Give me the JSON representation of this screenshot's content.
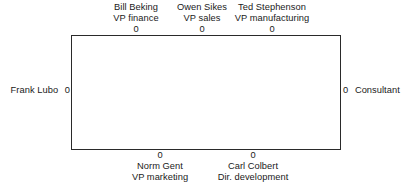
{
  "diagram": {
    "type": "boundary-node-diagram",
    "title": "",
    "box": {
      "label": "",
      "border_color": "#2a2a2a",
      "fill_color": "#ffffff"
    },
    "port_marker": "0",
    "nodes": {
      "top": [
        {
          "name": "Bill Beking",
          "title": "VP finance",
          "port": "0"
        },
        {
          "name": "Owen Sikes",
          "title": "VP sales",
          "port": "0"
        },
        {
          "name": "Ted Stephenson",
          "title": "VP manufacturing",
          "port": "0"
        }
      ],
      "bottom": [
        {
          "name": "Norm Gent",
          "title": "VP marketing",
          "port": "0"
        },
        {
          "name": "Carl Colbert",
          "title": "Dir. development",
          "port": "0"
        }
      ],
      "left": [
        {
          "name": "Frank Lubo",
          "title": "",
          "port": "0"
        }
      ],
      "right": [
        {
          "name": "Consultant",
          "title": "",
          "port": "0"
        }
      ]
    }
  }
}
